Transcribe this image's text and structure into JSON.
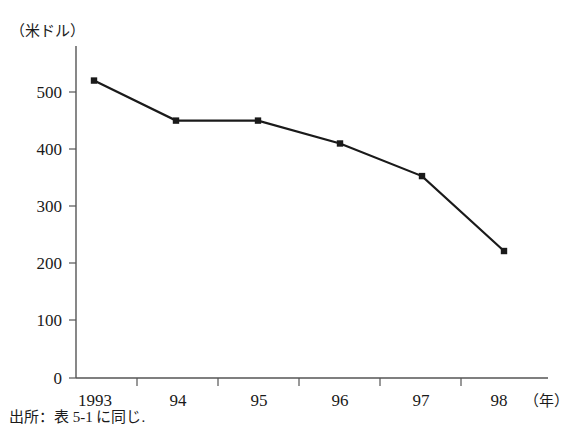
{
  "chart_data": {
    "type": "line",
    "title": "",
    "subtitle": "",
    "ylabel": "（米ドル）",
    "xlabel": "（年）",
    "categories": [
      "1993",
      "94",
      "95",
      "96",
      "97",
      "98"
    ],
    "x": [
      1993,
      1994,
      1995,
      1996,
      1997,
      1998
    ],
    "values": [
      520,
      450,
      450,
      410,
      353,
      222
    ],
    "series": [
      {
        "name": "",
        "values": [
          520,
          450,
          450,
          410,
          353,
          222
        ]
      }
    ],
    "ylim": [
      0,
      560
    ],
    "yticks": [
      0,
      100,
      200,
      300,
      400,
      500
    ],
    "ytick_labels": [
      "0",
      "100",
      "200",
      "300",
      "400",
      "500"
    ],
    "xtick_labels": [
      "1993",
      "94",
      "95",
      "96",
      "97",
      "98"
    ],
    "grid": false,
    "legend": false,
    "legend_position": "none",
    "marker": "square",
    "line_color": "#1a1a1a",
    "marker_color": "#1a1a1a",
    "axis_color": "#555555",
    "background_color": "#ffffff"
  },
  "figure": {
    "y_unit_label": "（米ドル）",
    "x_unit_label": "（年）",
    "source_note": "出所：表 5-1 に同じ."
  }
}
